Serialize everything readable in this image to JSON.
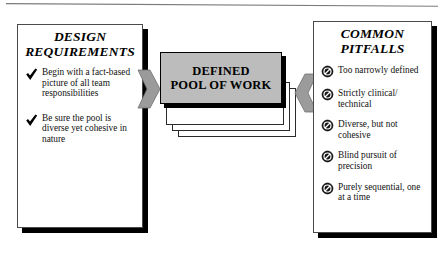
{
  "top_rule": {
    "name": "horizontal-rule",
    "color": "#7a7a7a"
  },
  "left_panel": {
    "title": "DESIGN REQUIREMENTS",
    "title_line1": "DESIGN",
    "title_line2": "REQUIREMENTS",
    "bullet_icon": "check-icon",
    "items": [
      "Begin with a fact-based picture of all team responsibilities",
      "Be sure the pool is diverse yet cohesive in nature"
    ]
  },
  "center": {
    "label": "DEFINED POOL OF WORK",
    "label_line1": "DEFINED",
    "label_line2": "POOL OF WORK",
    "sheet_count": 4,
    "fill_color": "#bcbcbc",
    "border_color": "#000000"
  },
  "arrows": {
    "left": {
      "name": "arrow-right-into-center",
      "direction": "right",
      "color": "#9b9b9b"
    },
    "right": {
      "name": "arrow-left-into-center",
      "direction": "left",
      "color": "#9b9b9b"
    }
  },
  "right_panel": {
    "title": "COMMON PITFALLS",
    "title_line1": "COMMON",
    "title_line2": "PITFALLS",
    "bullet_icon": "prohibition-icon",
    "items": [
      "Too narrowly defined",
      "Strictly clinical/ technical",
      "Diverse, but not cohesive",
      "Blind pursuit of precision",
      "Purely sequential, one at a time"
    ]
  }
}
